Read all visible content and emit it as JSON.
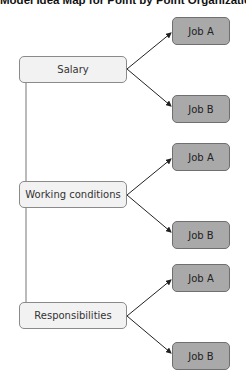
{
  "title": "Model Idea Map for Point by Point Organization",
  "categories": [
    {
      "label": "Salary",
      "top": 56,
      "jobs": [
        {
          "label": "Job A",
          "top": 17
        },
        {
          "label": "Job B",
          "top": 95
        }
      ]
    },
    {
      "label": "Working conditions",
      "top": 181,
      "jobs": [
        {
          "label": "Job A",
          "top": 143
        },
        {
          "label": "Job B",
          "top": 221
        }
      ]
    },
    {
      "label": "Responsibilities",
      "top": 302,
      "jobs": [
        {
          "label": "Job A",
          "top": 264
        },
        {
          "label": "Job B",
          "top": 342
        }
      ]
    }
  ],
  "colors": {
    "category_fill": "#f2f2f2",
    "job_fill": "#a9a9a9",
    "line": "#222222"
  }
}
